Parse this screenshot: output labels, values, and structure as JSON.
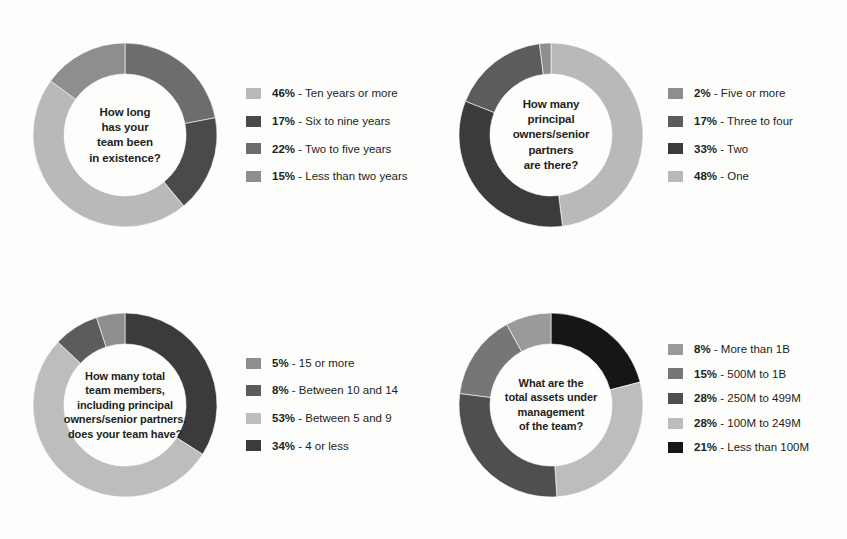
{
  "palette": {
    "light": "#b9b9b9",
    "light2": "#c9c9c9",
    "medium": "#8e8e8e",
    "medium_dark": "#6d6d6d",
    "dark": "#4a4a4a",
    "darker": "#3b3b3b",
    "black": "#161616",
    "text": "#231f20",
    "background": "#fdfdfc"
  },
  "chart_data": [
    {
      "type": "pie",
      "id": "team-tenure",
      "title": "How long has your team been in existence?",
      "center_lines": [
        "How long",
        "has your",
        "team been",
        "in existence?"
      ],
      "legend_position": "right",
      "start_angle": 0,
      "direction": "clockwise",
      "categories": [
        "Ten years or more",
        "Six to nine years",
        "Two to five years",
        "Less than two years"
      ],
      "values": [
        46,
        17,
        22,
        15
      ],
      "unit": "%",
      "segment_order_clockwise": [
        "Two to five years",
        "Six to nine years",
        "Ten years or more",
        "Less than two years"
      ],
      "legend": [
        {
          "pct": "46%",
          "dash": "-",
          "label": "Ten years or more",
          "color": "#b9b9b9"
        },
        {
          "pct": "17%",
          "dash": "-",
          "label": "Six to nine years",
          "color": "#4a4a4a"
        },
        {
          "pct": "22%",
          "dash": "-",
          "label": "Two to five years",
          "color": "#6d6d6d"
        },
        {
          "pct": "15%",
          "dash": "-",
          "label": "Less than two years",
          "color": "#8e8e8e"
        }
      ]
    },
    {
      "type": "pie",
      "id": "principal-owners",
      "title": "How many principal owners/senior partners are there?",
      "center_lines": [
        "How many",
        "principal",
        "owners/senior",
        "partners",
        "are there?"
      ],
      "legend_position": "right",
      "start_angle": 0,
      "direction": "clockwise",
      "categories": [
        "Five or more",
        "Three to four",
        "Two",
        "One"
      ],
      "values": [
        2,
        17,
        33,
        48
      ],
      "unit": "%",
      "segment_order_clockwise": [
        "One",
        "Two",
        "Three to four",
        "Five or more"
      ],
      "legend": [
        {
          "pct": "2%",
          "dash": "-",
          "label": "Five or more",
          "color": "#8e8e8e"
        },
        {
          "pct": "17%",
          "dash": "-",
          "label": "Three to four",
          "color": "#5c5c5c"
        },
        {
          "pct": "33%",
          "dash": "-",
          "label": "Two",
          "color": "#3b3b3b"
        },
        {
          "pct": "48%",
          "dash": "-",
          "label": "One",
          "color": "#b9b9b9"
        }
      ]
    },
    {
      "type": "pie",
      "id": "team-size",
      "title": "How many total team members, including principal owners/senior partners, does your team have?",
      "center_lines": [
        "How many total",
        "team members,",
        "including principal",
        "owners/senior partners,",
        "does your team have?"
      ],
      "legend_position": "right",
      "start_angle": 0,
      "direction": "clockwise",
      "categories": [
        "15 or more",
        "Between 10 and 14",
        "Between 5 and 9",
        "4 or less"
      ],
      "values": [
        5,
        8,
        53,
        34
      ],
      "unit": "%",
      "segment_order_clockwise": [
        "4 or less",
        "Between 5 and 9",
        "Between 10 and 14",
        "15 or more"
      ],
      "legend": [
        {
          "pct": "5%",
          "dash": "-",
          "label": "15 or more",
          "color": "#8e8e8e"
        },
        {
          "pct": "8%",
          "dash": "-",
          "label": "Between 10 and 14",
          "color": "#5c5c5c"
        },
        {
          "pct": "53%",
          "dash": "-",
          "label": "Between 5 and 9",
          "color": "#bdbdbd"
        },
        {
          "pct": "34%",
          "dash": "-",
          "label": "4 or less",
          "color": "#3b3b3b"
        }
      ]
    },
    {
      "type": "pie",
      "id": "assets-under-management",
      "title": "What are the total assets under management of the team?",
      "center_lines": [
        "What are the",
        "total assets under",
        "management",
        "of the team?"
      ],
      "legend_position": "right",
      "start_angle": 0,
      "direction": "clockwise",
      "categories": [
        "More than 1B",
        "500M to 1B",
        "250M to 499M",
        "100M to 249M",
        "Less than 100M"
      ],
      "values": [
        8,
        15,
        28,
        28,
        21
      ],
      "unit": "%",
      "segment_order_clockwise": [
        "Less than 100M",
        "100M to 249M",
        "250M to 499M",
        "500M to 1B",
        "More than 1B"
      ],
      "legend": [
        {
          "pct": "8%",
          "dash": "-",
          "label": "More than 1B",
          "color": "#9a9a9a"
        },
        {
          "pct": "15%",
          "dash": "-",
          "label": "500M to 1B",
          "color": "#767676"
        },
        {
          "pct": "28%",
          "dash": "-",
          "label": "250M to 499M",
          "color": "#4f4f4f"
        },
        {
          "pct": "28%",
          "dash": "-",
          "label": "100M to 249M",
          "color": "#bdbdbd"
        },
        {
          "pct": "21%",
          "dash": "-",
          "label": "Less than 100M",
          "color": "#161616"
        }
      ]
    }
  ]
}
